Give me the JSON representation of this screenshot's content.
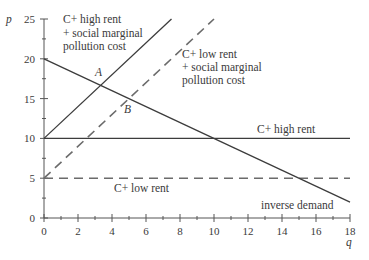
{
  "chart_data": {
    "type": "line",
    "title": "",
    "xlabel": "q",
    "ylabel": "p",
    "xlim": [
      0,
      18
    ],
    "ylim": [
      0,
      25
    ],
    "x_ticks": [
      0,
      2,
      4,
      6,
      8,
      10,
      12,
      14,
      16,
      18
    ],
    "y_ticks": [
      0,
      5,
      10,
      15,
      20,
      25
    ],
    "grid": false,
    "legend": "none (inline labels)",
    "series": [
      {
        "name": "C+ high rent + social marginal pollution cost",
        "style": "solid",
        "x": [
          0,
          7.5
        ],
        "y": [
          10,
          25
        ]
      },
      {
        "name": "C+ low rent + social marginal pollution cost",
        "style": "dashed",
        "x": [
          0,
          10
        ],
        "y": [
          5,
          25
        ]
      },
      {
        "name": "C+ high rent",
        "style": "solid",
        "x": [
          0,
          18
        ],
        "y": [
          10,
          10
        ]
      },
      {
        "name": "C+ low rent",
        "style": "dashed",
        "x": [
          0,
          18
        ],
        "y": [
          5,
          5
        ]
      },
      {
        "name": "inverse demand",
        "style": "solid",
        "x": [
          0,
          18
        ],
        "y": [
          20,
          2
        ]
      }
    ],
    "annotations": [
      {
        "label": "A",
        "x": 3.33,
        "y": 16.67
      },
      {
        "label": "B",
        "x": 5,
        "y": 15
      }
    ]
  },
  "labels": {
    "y_axis": "p",
    "x_axis": "q",
    "high_rent_social": [
      "C+ high rent",
      "+ social marginal",
      "pollution cost"
    ],
    "low_rent_social": [
      "C+ low rent",
      "+ social marginal",
      "pollution cost"
    ],
    "high_rent": "C+ high rent",
    "low_rent": "C+ low rent",
    "demand": "inverse demand",
    "point_a": "A",
    "point_b": "B"
  },
  "ticks": {
    "x": [
      "0",
      "2",
      "4",
      "6",
      "8",
      "10",
      "12",
      "14",
      "16",
      "18"
    ],
    "y": [
      "0",
      "5",
      "10",
      "15",
      "20",
      "25"
    ]
  }
}
